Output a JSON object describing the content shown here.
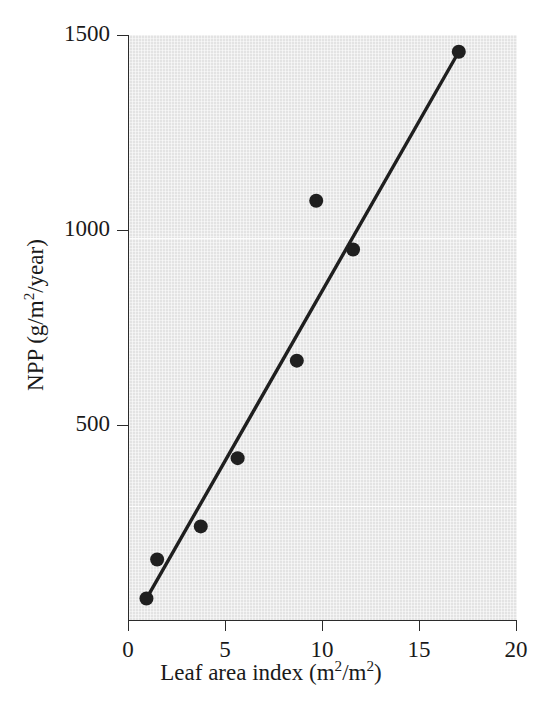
{
  "chart_data": {
    "type": "scatter",
    "title": "",
    "xlabel": "Leaf area index (m2/m2)",
    "xlabel_parts": {
      "text": "Leaf area index (m",
      "sup1": "2",
      "mid": "/m",
      "sup2": "2",
      "close": ")"
    },
    "ylabel": "NPP (g/m2/year)",
    "ylabel_parts": {
      "text": "NPP (g/m",
      "sup1": "2",
      "close": "/year)"
    },
    "xlim": [
      0,
      20
    ],
    "ylim": [
      0,
      1500
    ],
    "xticks": [
      0,
      5,
      10,
      15,
      20
    ],
    "xtick_labels": [
      "0",
      "5",
      "10",
      "15",
      "20"
    ],
    "yticks": [
      500,
      1000,
      1500
    ],
    "ytick_labels": [
      "500",
      "1000",
      "1500"
    ],
    "grid": true,
    "legend": null,
    "x": [
      0.9,
      1.45,
      3.7,
      5.6,
      8.65,
      9.65,
      11.55,
      17.0
    ],
    "y": [
      55,
      155,
      240,
      415,
      665,
      1075,
      950,
      1457
    ],
    "points": [
      {
        "x": 0.9,
        "y": 55
      },
      {
        "x": 1.45,
        "y": 155
      },
      {
        "x": 3.7,
        "y": 240
      },
      {
        "x": 5.6,
        "y": 415
      },
      {
        "x": 8.65,
        "y": 665
      },
      {
        "x": 9.65,
        "y": 1075
      },
      {
        "x": 11.55,
        "y": 950
      },
      {
        "x": 17.0,
        "y": 1457
      }
    ],
    "trendline": {
      "type": "line",
      "x0": 0.9,
      "y0": 55,
      "x1": 17.0,
      "y1": 1457
    },
    "marker_color": "#1f1f1f",
    "line_color": "#1f1f1f",
    "plot_background": "#e3e3e3",
    "axis_color": "#2b2b2b"
  }
}
